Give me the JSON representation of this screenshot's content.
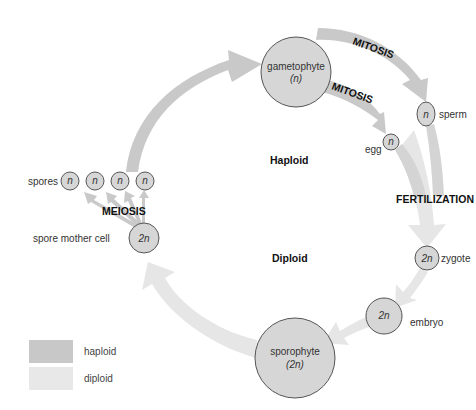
{
  "diagram": {
    "regions": {
      "haploid": "Haploid",
      "diploid": "Diploid"
    },
    "processes": {
      "mitosis_sperm": "MITOSIS",
      "mitosis_egg": "MITOSIS",
      "fertilization": "FERTILIZATION",
      "meiosis": "MEIOSIS"
    },
    "nodes": {
      "gametophyte": {
        "name": "gametophyte",
        "ploidy": "(n)"
      },
      "sperm": {
        "name": "sperm",
        "ploidy": "n"
      },
      "egg": {
        "name": "egg",
        "ploidy": "n"
      },
      "zygote": {
        "name": "zygote",
        "ploidy": "2n"
      },
      "embryo": {
        "name": "embryo",
        "ploidy": "2n"
      },
      "sporophyte": {
        "name": "sporophyte",
        "ploidy": "(2n)"
      },
      "spore_mother_cell": {
        "name": "spore mother cell",
        "ploidy": "2n"
      },
      "spores": {
        "name": "spores",
        "ploidy": [
          "n",
          "n",
          "n",
          "n"
        ]
      }
    }
  },
  "legend": {
    "items": [
      {
        "label": "haploid",
        "color": "#c8c8c8"
      },
      {
        "label": "diploid",
        "color": "#e8e8e8"
      }
    ]
  },
  "colors": {
    "haploid_arrow": "#c9c9c9",
    "diploid_arrow": "#e6e6e6",
    "cell_fill": "#d6d6d6",
    "cell_stroke": "#555555"
  }
}
